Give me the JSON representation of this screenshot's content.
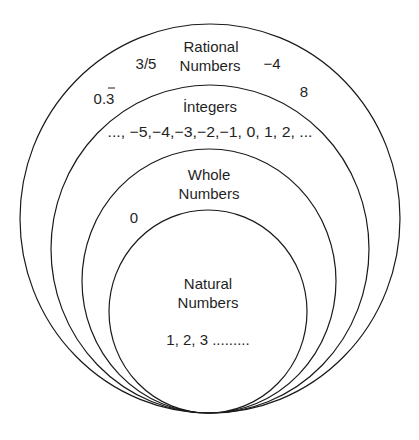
{
  "diagram": {
    "sets": [
      {
        "name": "Rational Numbers",
        "label_line1": "Rational",
        "label_line2": "Numbers",
        "examples": [
          "3/5",
          "−4",
          "0.3",
          "8"
        ],
        "repeating_decimal_note": "0.3 with bar over 3"
      },
      {
        "name": "Integers",
        "label_line1": "İntegers",
        "examples_text": "..., −5,−4,−3,−2,−1, 0, 1, 2, ..."
      },
      {
        "name": "Whole Numbers",
        "label_line1": "Whole",
        "label_line2": "Numbers",
        "examples": [
          "0"
        ]
      },
      {
        "name": "Natural Numbers",
        "label_line1": "Natural",
        "label_line2": "Numbers",
        "examples_text": "1, 2, 3 ........."
      }
    ],
    "colors": {
      "stroke": "#1a1a1a",
      "text": "#1f1f1f",
      "background": "#ffffff"
    }
  }
}
